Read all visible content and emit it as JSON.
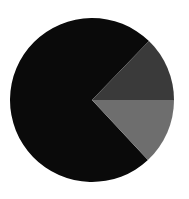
{
  "chart_data": {
    "type": "pie",
    "title": "",
    "legend": [],
    "labels": [
      "Slice A",
      "Slice B",
      "Slice C"
    ],
    "values": [
      74,
      13,
      13
    ],
    "colors": [
      "#0a0a0a",
      "#3a3a3a",
      "#6e6e6e"
    ],
    "start_angle_deg": 0,
    "direction": "clockwise",
    "note": "Values estimated from slice angles; no labels or legend visible",
    "layout": {
      "center": [
        92,
        100
      ],
      "radius": 82
    }
  },
  "slices": [
    {
      "name": "large-black-slice",
      "start": 47,
      "end": 314,
      "color": "#0a0a0a"
    },
    {
      "name": "upper-dark-gray-slice",
      "start": 314,
      "end": 360,
      "color": "#3a3a3a"
    },
    {
      "name": "lower-mid-gray-slice",
      "start": 0,
      "end": 47,
      "color": "#6e6e6e"
    }
  ]
}
